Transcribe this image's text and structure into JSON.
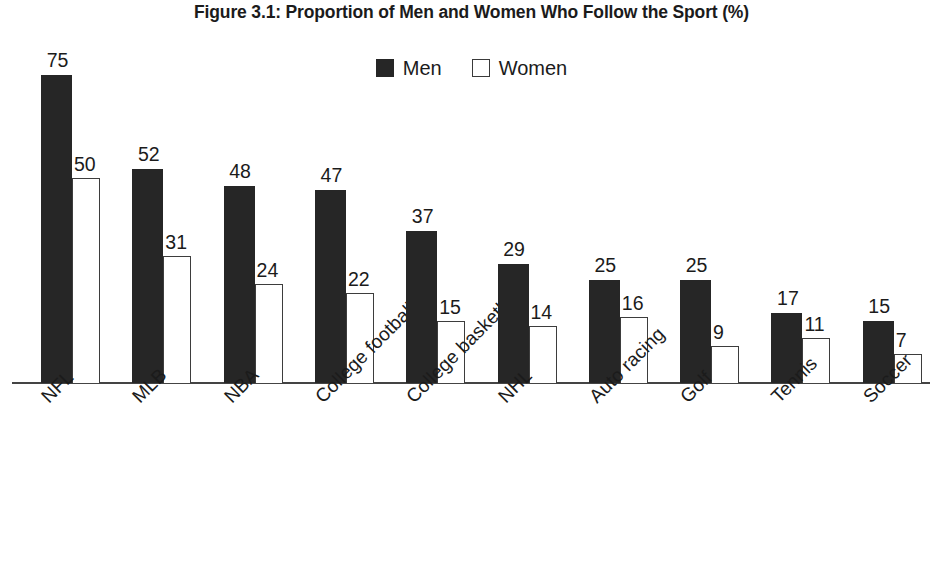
{
  "chart_data": {
    "type": "bar",
    "title": "Figure 3.1: Proportion of Men and Women Who Follow the Sport (%)",
    "xlabel": "",
    "ylabel": "",
    "ylim": [
      0,
      75
    ],
    "grid": false,
    "legend_position": "top-center",
    "categories": [
      "NFL",
      "MLB",
      "NBA",
      "College football",
      "College basketball",
      "NHL",
      "Auto racing",
      "Golf",
      "Tennis",
      "Soccer"
    ],
    "series": [
      {
        "name": "Men",
        "color": "#262626",
        "values": [
          75,
          52,
          48,
          47,
          37,
          29,
          25,
          25,
          17,
          15
        ]
      },
      {
        "name": "Women",
        "color": "#ffffff",
        "values": [
          50,
          31,
          24,
          22,
          15,
          14,
          16,
          9,
          11,
          7
        ]
      }
    ],
    "data_labels": {
      "men": [
        "75",
        "52",
        "48",
        "47",
        "37",
        "29",
        "25",
        "25",
        "17",
        "15"
      ],
      "women": [
        "50",
        "31",
        "24",
        "22",
        "15",
        "14",
        "16",
        "9",
        "11",
        "7"
      ]
    }
  },
  "legend": {
    "entries": [
      {
        "label": "Men",
        "swatch": "filled-square-icon"
      },
      {
        "label": "Women",
        "swatch": "outlined-square-icon"
      }
    ]
  },
  "colors": {
    "men_bar": "#262626",
    "women_bar_fill": "#ffffff",
    "women_bar_stroke": "#3d3d3d",
    "axis": "#444444",
    "text": "#1b1b1b",
    "background": "#ffffff"
  }
}
